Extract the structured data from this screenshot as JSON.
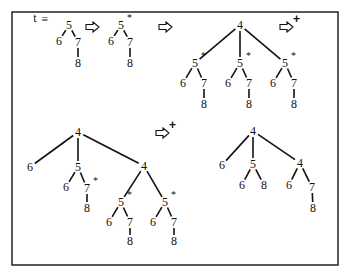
{
  "figure": {
    "prefix_label": "t",
    "equals_label": "≡",
    "star_marker": "*",
    "plus_marker": "+",
    "arrow_icon": "hollow-right-arrow"
  },
  "trees": [
    {
      "id": "t-original",
      "nodes": [
        {
          "id": "a",
          "label": "5",
          "x": 69,
          "y": 25
        },
        {
          "id": "b",
          "label": "6",
          "x": 59,
          "y": 41
        },
        {
          "id": "c",
          "label": "7",
          "x": 78,
          "y": 42
        },
        {
          "id": "d",
          "label": "8",
          "x": 78,
          "y": 63
        }
      ],
      "edges": [
        [
          "a",
          "b"
        ],
        [
          "a",
          "c"
        ],
        [
          "c",
          "d"
        ]
      ]
    },
    {
      "id": "t-starred",
      "nodes": [
        {
          "id": "a",
          "label": "5",
          "x": 121,
          "y": 25,
          "star": true
        },
        {
          "id": "b",
          "label": "6",
          "x": 111,
          "y": 41
        },
        {
          "id": "c",
          "label": "7",
          "x": 130,
          "y": 42
        },
        {
          "id": "d",
          "label": "8",
          "x": 130,
          "y": 63
        }
      ],
      "edges": [
        [
          "a",
          "b"
        ],
        [
          "a",
          "c"
        ],
        [
          "c",
          "d"
        ]
      ]
    },
    {
      "id": "t-expanded-top",
      "nodes": [
        {
          "id": "r",
          "label": "4",
          "x": 240,
          "y": 25
        },
        {
          "id": "a1",
          "label": "5",
          "x": 195,
          "y": 63,
          "star": true
        },
        {
          "id": "b1",
          "label": "6",
          "x": 183,
          "y": 83
        },
        {
          "id": "c1",
          "label": "7",
          "x": 204,
          "y": 83
        },
        {
          "id": "d1",
          "label": "8",
          "x": 204,
          "y": 104
        },
        {
          "id": "a2",
          "label": "5",
          "x": 240,
          "y": 63,
          "star": true
        },
        {
          "id": "b2",
          "label": "6",
          "x": 228,
          "y": 83
        },
        {
          "id": "c2",
          "label": "7",
          "x": 249,
          "y": 83
        },
        {
          "id": "d2",
          "label": "8",
          "x": 249,
          "y": 104
        },
        {
          "id": "a3",
          "label": "5",
          "x": 285,
          "y": 63,
          "star": true
        },
        {
          "id": "b3",
          "label": "6",
          "x": 273,
          "y": 83
        },
        {
          "id": "c3",
          "label": "7",
          "x": 294,
          "y": 83
        },
        {
          "id": "d3",
          "label": "8",
          "x": 294,
          "y": 104
        }
      ],
      "edges": [
        [
          "r",
          "a1"
        ],
        [
          "r",
          "a2"
        ],
        [
          "r",
          "a3"
        ],
        [
          "a1",
          "b1"
        ],
        [
          "a1",
          "c1"
        ],
        [
          "c1",
          "d1"
        ],
        [
          "a2",
          "b2"
        ],
        [
          "a2",
          "c2"
        ],
        [
          "c2",
          "d2"
        ],
        [
          "a3",
          "b3"
        ],
        [
          "a3",
          "c3"
        ],
        [
          "c3",
          "d3"
        ]
      ]
    },
    {
      "id": "t-expanded-bottom-left",
      "nodes": [
        {
          "id": "r",
          "label": "4",
          "x": 78,
          "y": 132
        },
        {
          "id": "l6",
          "label": "6",
          "x": 30,
          "y": 167
        },
        {
          "id": "m5",
          "label": "5",
          "x": 78,
          "y": 167
        },
        {
          "id": "m6",
          "label": "6",
          "x": 66,
          "y": 187
        },
        {
          "id": "m7",
          "label": "7",
          "x": 87,
          "y": 188,
          "star": true
        },
        {
          "id": "m8",
          "label": "8",
          "x": 87,
          "y": 208
        },
        {
          "id": "r4",
          "label": "4",
          "x": 144,
          "y": 166
        },
        {
          "id": "p5",
          "label": "5",
          "x": 121,
          "y": 202,
          "star": true
        },
        {
          "id": "p6",
          "label": "6",
          "x": 109,
          "y": 222
        },
        {
          "id": "p7",
          "label": "7",
          "x": 130,
          "y": 222
        },
        {
          "id": "p8",
          "label": "8",
          "x": 130,
          "y": 241
        },
        {
          "id": "q5",
          "label": "5",
          "x": 165,
          "y": 202,
          "star": true
        },
        {
          "id": "q6",
          "label": "6",
          "x": 153,
          "y": 222
        },
        {
          "id": "q7",
          "label": "7",
          "x": 174,
          "y": 222
        },
        {
          "id": "q8",
          "label": "8",
          "x": 174,
          "y": 241
        }
      ],
      "edges": [
        [
          "r",
          "l6"
        ],
        [
          "r",
          "m5"
        ],
        [
          "r",
          "r4"
        ],
        [
          "m5",
          "m6"
        ],
        [
          "m5",
          "m7"
        ],
        [
          "m7",
          "m8"
        ],
        [
          "r4",
          "p5"
        ],
        [
          "r4",
          "q5"
        ],
        [
          "p5",
          "p6"
        ],
        [
          "p5",
          "p7"
        ],
        [
          "p7",
          "p8"
        ],
        [
          "q5",
          "q6"
        ],
        [
          "q5",
          "q7"
        ],
        [
          "q7",
          "q8"
        ]
      ]
    },
    {
      "id": "t-final",
      "nodes": [
        {
          "id": "r",
          "label": "4",
          "x": 253,
          "y": 131
        },
        {
          "id": "l6",
          "label": "6",
          "x": 222,
          "y": 165
        },
        {
          "id": "m5",
          "label": "5",
          "x": 253,
          "y": 164
        },
        {
          "id": "m6",
          "label": "6",
          "x": 242,
          "y": 185
        },
        {
          "id": "m8",
          "label": "8",
          "x": 264,
          "y": 185
        },
        {
          "id": "r4",
          "label": "4",
          "x": 300,
          "y": 163
        },
        {
          "id": "r6",
          "label": "6",
          "x": 289,
          "y": 185
        },
        {
          "id": "r7",
          "label": "7",
          "x": 312,
          "y": 187
        },
        {
          "id": "r8",
          "label": "8",
          "x": 313,
          "y": 208
        }
      ],
      "edges": [
        [
          "r",
          "l6"
        ],
        [
          "r",
          "m5"
        ],
        [
          "r",
          "r4"
        ],
        [
          "m5",
          "m6"
        ],
        [
          "m5",
          "m8"
        ],
        [
          "r4",
          "r6"
        ],
        [
          "r4",
          "r7"
        ],
        [
          "r7",
          "r8"
        ]
      ]
    }
  ],
  "arrows": [
    {
      "id": "arrow-1",
      "x": 93,
      "y": 27,
      "plus": false
    },
    {
      "id": "arrow-2",
      "x": 166,
      "y": 27,
      "plus": false
    },
    {
      "id": "arrow-3",
      "x": 287,
      "y": 27,
      "plus": true
    },
    {
      "id": "arrow-4",
      "x": 163,
      "y": 133,
      "plus": true
    }
  ]
}
